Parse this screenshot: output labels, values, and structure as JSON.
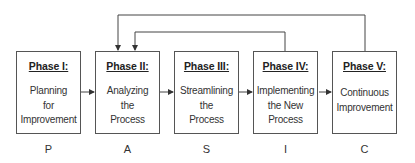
{
  "phases": [
    {
      "title": "Phase I:",
      "body": "Planning\nfor\nImprovement",
      "letter": "P"
    },
    {
      "title": "Phase II:",
      "body": "Analyzing\nthe\nProcess",
      "letter": "A"
    },
    {
      "title": "Phase III:",
      "body": "Streamlining\nthe\nProcess",
      "letter": "S"
    },
    {
      "title": "Phase IV:",
      "body": "Implementing\nthe New\nProcess",
      "letter": "I"
    },
    {
      "title": "Phase V:",
      "body": "Continuous\nImprovement",
      "letter": "C"
    }
  ],
  "connectors": {
    "sequence": [
      "I->II",
      "II->III",
      "III->IV",
      "IV->V"
    ],
    "feedback_loops": [
      "V->II",
      "IV->II"
    ]
  },
  "colors": {
    "line": "#444444",
    "border": "#555555",
    "text": "#2a2a2a"
  }
}
